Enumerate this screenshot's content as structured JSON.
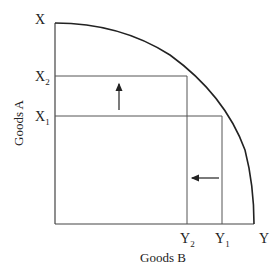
{
  "diagram": {
    "type": "production-possibility-frontier",
    "y_axis_label": "Goods A",
    "x_axis_label": "Goods B",
    "y_ticks": [
      {
        "main": "X",
        "sub": ""
      },
      {
        "main": "X",
        "sub": "2"
      },
      {
        "main": "X",
        "sub": "1"
      }
    ],
    "x_ticks": [
      {
        "main": "Y",
        "sub": "2"
      },
      {
        "main": "Y",
        "sub": "1"
      },
      {
        "main": "Y",
        "sub": ""
      }
    ],
    "arrows": [
      {
        "direction": "up",
        "meaning": "increase from X1 to X2"
      },
      {
        "direction": "left",
        "meaning": "decrease from Y1 to Y2"
      }
    ],
    "colors": {
      "line": "#333333",
      "curve": "#222222"
    }
  }
}
